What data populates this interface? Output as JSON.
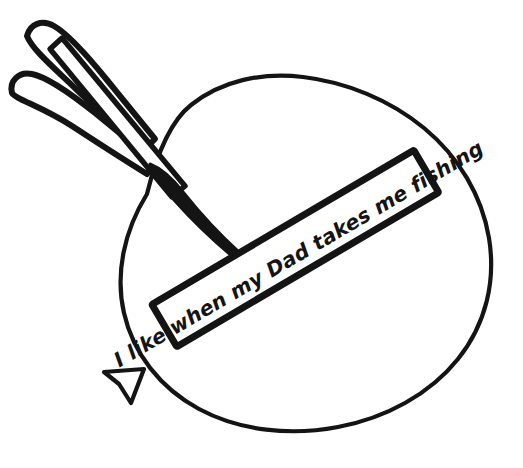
{
  "page": {
    "title": "I like when my Dad takes me fishing",
    "kind": "coloring-page-line-art",
    "background_color": "#ffffff",
    "ink_color": "#141414",
    "width": 523,
    "height": 468
  },
  "artwork": {
    "name": "balloon-with-fishing-lure-and-banner",
    "description": "Black and white line drawing of a balloon pierced by a fishing lure with a ribbon banner across it",
    "elements": {
      "balloon": {
        "label": "balloon",
        "outline_color": "#141414",
        "fill_color": "#ffffff",
        "stroke_width": 4
      },
      "balloon_knot": {
        "label": "balloon knot",
        "outline_color": "#141414",
        "fill_color": "#ffffff",
        "stroke_width": 4
      },
      "lure": {
        "label": "fishing lure",
        "outline_color": "#141414",
        "fill_color": "#ffffff",
        "stroke_width": 5,
        "parts": [
          "upper feather",
          "lower feather",
          "shaft",
          "barb point"
        ]
      },
      "banner": {
        "label": "banner ribbon",
        "outline_color": "#141414",
        "fill_color": "#ffffff",
        "stroke_width": 7,
        "rotation_degrees": -30,
        "caption": "I like when my Dad takes me fishing"
      }
    }
  }
}
